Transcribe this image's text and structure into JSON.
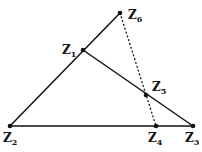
{
  "diagram": {
    "points": {
      "Z1": {
        "label": "Z",
        "sub": "1",
        "x": 83,
        "y": 50,
        "lx": 62,
        "ly": 54
      },
      "Z2": {
        "label": "Z",
        "sub": "2",
        "x": 10,
        "y": 126,
        "lx": 3,
        "ly": 142
      },
      "Z3": {
        "label": "Z",
        "sub": "3",
        "x": 193,
        "y": 126,
        "lx": 185,
        "ly": 142
      },
      "Z4": {
        "label": "Z",
        "sub": "4",
        "x": 156,
        "y": 126,
        "lx": 148,
        "ly": 142
      },
      "Z5": {
        "label": "Z",
        "sub": "5",
        "x": 146,
        "y": 95,
        "lx": 152,
        "ly": 91
      },
      "Z6": {
        "label": "Z",
        "sub": "6",
        "x": 120,
        "y": 13,
        "lx": 128,
        "ly": 19
      }
    },
    "segments": [
      {
        "from": "Z2",
        "to": "Z6",
        "style": "solid"
      },
      {
        "from": "Z2",
        "to": "Z3",
        "style": "solid"
      },
      {
        "from": "Z1",
        "to": "Z3",
        "style": "solid"
      },
      {
        "from": "Z6",
        "to": "Z4",
        "style": "dotted"
      }
    ],
    "colors": {
      "stroke": "#111111",
      "background": "#ffffff"
    }
  }
}
